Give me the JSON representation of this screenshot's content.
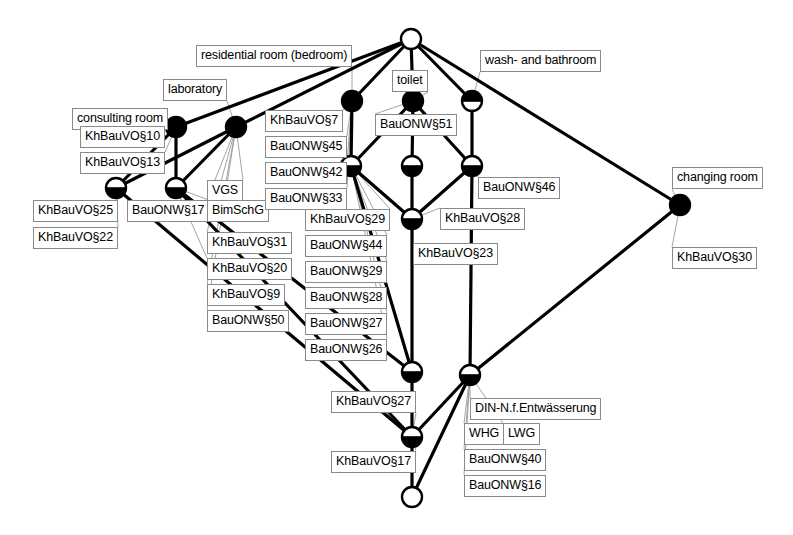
{
  "diagram": {
    "type": "concept-lattice",
    "title": "",
    "colors": {
      "line": "#000000",
      "node_fill": "#000000",
      "node_empty": "#ffffff",
      "label_border": "#8a8a8a",
      "label_background": "#ffffff",
      "leader_line": "#9a9a9a",
      "background": "#ffffff"
    },
    "object_labels": [
      {
        "id": "obj-residential-room",
        "text": "residential room (bedroom)",
        "x": 196,
        "y": 45,
        "node": "n-top-mid-left"
      },
      {
        "id": "obj-laboratory",
        "text": "laboratory",
        "x": 163,
        "y": 79,
        "node": "n-lab"
      },
      {
        "id": "obj-consulting-room",
        "text": "consulting room",
        "x": 72,
        "y": 108,
        "node": "n-consult"
      },
      {
        "id": "obj-toilet",
        "text": "toilet",
        "x": 392,
        "y": 70,
        "node": "n-toilet"
      },
      {
        "id": "obj-wash-bathroom",
        "text": "wash- and bathroom",
        "x": 480,
        "y": 50,
        "node": "n-wash"
      },
      {
        "id": "obj-changing-room",
        "text": "changing room",
        "x": 672,
        "y": 167,
        "node": "n-changing"
      }
    ],
    "attribute_labels": [
      {
        "id": "attr-khbauvo10",
        "text": "KhBauVO§10",
        "x": 80,
        "y": 126,
        "node": "n-consult"
      },
      {
        "id": "attr-khbauvo13",
        "text": "KhBauVO§13",
        "x": 80,
        "y": 152,
        "node": "n-consult"
      },
      {
        "id": "attr-khbauvo25",
        "text": "KhBauVO§25",
        "x": 33,
        "y": 200,
        "node": "n-l1"
      },
      {
        "id": "attr-khbauvo22",
        "text": "KhBauVO§22",
        "x": 33,
        "y": 227,
        "node": "n-l1"
      },
      {
        "id": "attr-bauonw17",
        "text": "BauONW§17",
        "x": 127,
        "y": 200,
        "node": "n-l2"
      },
      {
        "id": "attr-vgs",
        "text": "VGS",
        "x": 207,
        "y": 180,
        "node": "n-lab"
      },
      {
        "id": "attr-bimschg",
        "text": "BimSchG",
        "x": 207,
        "y": 200,
        "node": "n-lab"
      },
      {
        "id": "attr-khbauvo31",
        "text": "KhBauVO§31",
        "x": 207,
        "y": 232,
        "node": "n-lab"
      },
      {
        "id": "attr-khbauvo20",
        "text": "KhBauVO§20",
        "x": 207,
        "y": 258,
        "node": "n-l2"
      },
      {
        "id": "attr-khbauvo9",
        "text": "KhBauVO§9",
        "x": 207,
        "y": 284,
        "node": "n-lab"
      },
      {
        "id": "attr-bauonw50",
        "text": "BauONW§50",
        "x": 207,
        "y": 310,
        "node": "n-lab"
      },
      {
        "id": "attr-khbauvo7",
        "text": "KhBauVO§7",
        "x": 265,
        "y": 110,
        "node": "n-top-mid-left"
      },
      {
        "id": "attr-bauonw45",
        "text": "BauONW§45",
        "x": 265,
        "y": 136,
        "node": "n-top-mid-left"
      },
      {
        "id": "attr-bauonw42",
        "text": "BauONW§42",
        "x": 265,
        "y": 162,
        "node": "n-top-mid-left"
      },
      {
        "id": "attr-bauonw33",
        "text": "BauONW§33",
        "x": 265,
        "y": 188,
        "node": "n-top-mid-left"
      },
      {
        "id": "attr-khbauvo29",
        "text": "KhBauVO§29",
        "x": 305,
        "y": 209,
        "node": "n-m1"
      },
      {
        "id": "attr-bauonw44",
        "text": "BauONW§44",
        "x": 305,
        "y": 235,
        "node": "n-m1"
      },
      {
        "id": "attr-bauonw29",
        "text": "BauONW§29",
        "x": 305,
        "y": 261,
        "node": "n-m1"
      },
      {
        "id": "attr-bauonw28",
        "text": "BauONW§28",
        "x": 305,
        "y": 287,
        "node": "n-m1"
      },
      {
        "id": "attr-bauonw27",
        "text": "BauONW§27",
        "x": 305,
        "y": 313,
        "node": "n-m1"
      },
      {
        "id": "attr-bauonw26",
        "text": "BauONW§26",
        "x": 305,
        "y": 339,
        "node": "n-m1"
      },
      {
        "id": "attr-bauonw51",
        "text": "BauONW§51",
        "x": 375,
        "y": 114,
        "node": "n-toilet"
      },
      {
        "id": "attr-bauonw46",
        "text": "BauONW§46",
        "x": 478,
        "y": 177,
        "node": "n-wash2"
      },
      {
        "id": "attr-khbauvo28",
        "text": "KhBauVO§28",
        "x": 440,
        "y": 208,
        "node": "n-c2"
      },
      {
        "id": "attr-khbauvo23",
        "text": "KhBauVO§23",
        "x": 413,
        "y": 243,
        "node": "n-c2"
      },
      {
        "id": "attr-khbauvo27",
        "text": "KhBauVO§27",
        "x": 331,
        "y": 391,
        "node": "n-b2"
      },
      {
        "id": "attr-khbauvo17",
        "text": "KhBauVO§17",
        "x": 331,
        "y": 451,
        "node": "n-b2"
      },
      {
        "id": "attr-din-entwaesserung",
        "text": "DIN-N.f.Entwässerung",
        "x": 470,
        "y": 398,
        "node": "n-b3"
      },
      {
        "id": "attr-whg",
        "text": "WHG",
        "x": 464,
        "y": 423,
        "node": "n-b3"
      },
      {
        "id": "attr-lwg",
        "text": "LWG",
        "x": 503,
        "y": 423,
        "node": "n-b3"
      },
      {
        "id": "attr-bauonw40",
        "text": "BauONW§40",
        "x": 464,
        "y": 449,
        "node": "n-b3"
      },
      {
        "id": "attr-bauonw16",
        "text": "BauONW§16",
        "x": 464,
        "y": 475,
        "node": "n-b3"
      },
      {
        "id": "attr-khbauvo30",
        "text": "KhBauVO§30",
        "x": 672,
        "y": 247,
        "node": "n-changing"
      },
      {
        "id": "attr-khbauvo29b",
        "text": "",
        "x": 0,
        "y": 0,
        "node": ""
      }
    ],
    "nodes": [
      {
        "id": "n-top",
        "x": 411,
        "y": 39,
        "r": 10,
        "fill": "empty"
      },
      {
        "id": "n-consult",
        "x": 176,
        "y": 127,
        "r": 10,
        "fill": "full"
      },
      {
        "id": "n-lab",
        "x": 236,
        "y": 127,
        "r": 10,
        "fill": "full"
      },
      {
        "id": "n-top-mid-left",
        "x": 352,
        "y": 101,
        "r": 10,
        "fill": "full"
      },
      {
        "id": "n-toilet",
        "x": 413,
        "y": 101,
        "r": 10,
        "fill": "full"
      },
      {
        "id": "n-wash",
        "x": 472,
        "y": 101,
        "r": 10,
        "fill": "top"
      },
      {
        "id": "n-changing",
        "x": 680,
        "y": 205,
        "r": 10,
        "fill": "full"
      },
      {
        "id": "n-l1",
        "x": 116,
        "y": 188,
        "r": 10,
        "fill": "bottom"
      },
      {
        "id": "n-l2",
        "x": 176,
        "y": 188,
        "r": 10,
        "fill": "bottom"
      },
      {
        "id": "n-m1",
        "x": 351,
        "y": 166,
        "r": 10,
        "fill": "bottom"
      },
      {
        "id": "n-m2",
        "x": 412,
        "y": 166,
        "r": 10,
        "fill": "bottom"
      },
      {
        "id": "n-wash2",
        "x": 472,
        "y": 166,
        "r": 10,
        "fill": "bottom"
      },
      {
        "id": "n-c2",
        "x": 412,
        "y": 219,
        "r": 10,
        "fill": "bottom"
      },
      {
        "id": "n-b1",
        "x": 412,
        "y": 372,
        "r": 10,
        "fill": "bottom"
      },
      {
        "id": "n-b3",
        "x": 470,
        "y": 375,
        "r": 10,
        "fill": "bottom"
      },
      {
        "id": "n-b2",
        "x": 412,
        "y": 437,
        "r": 10,
        "fill": "bottom"
      },
      {
        "id": "n-bottom",
        "x": 412,
        "y": 497,
        "r": 10,
        "fill": "empty"
      }
    ],
    "edges": [
      {
        "from": "n-top",
        "to": "n-consult"
      },
      {
        "from": "n-top",
        "to": "n-lab"
      },
      {
        "from": "n-top",
        "to": "n-top-mid-left"
      },
      {
        "from": "n-top",
        "to": "n-toilet"
      },
      {
        "from": "n-top",
        "to": "n-wash"
      },
      {
        "from": "n-top",
        "to": "n-changing"
      },
      {
        "from": "n-consult",
        "to": "n-l1"
      },
      {
        "from": "n-consult",
        "to": "n-l2"
      },
      {
        "from": "n-lab",
        "to": "n-l1"
      },
      {
        "from": "n-lab",
        "to": "n-l2"
      },
      {
        "from": "n-top-mid-left",
        "to": "n-m1"
      },
      {
        "from": "n-toilet",
        "to": "n-m1"
      },
      {
        "from": "n-toilet",
        "to": "n-m2"
      },
      {
        "from": "n-wash",
        "to": "n-wash2"
      },
      {
        "from": "n-toilet",
        "to": "n-wash2"
      },
      {
        "from": "n-m1",
        "to": "n-c2"
      },
      {
        "from": "n-m2",
        "to": "n-c2"
      },
      {
        "from": "n-wash2",
        "to": "n-c2"
      },
      {
        "from": "n-wash2",
        "to": "n-b3"
      },
      {
        "from": "n-c2",
        "to": "n-b1"
      },
      {
        "from": "n-l1",
        "to": "n-b2"
      },
      {
        "from": "n-l2",
        "to": "n-b1"
      },
      {
        "from": "n-l2",
        "to": "n-b2"
      },
      {
        "from": "n-m1",
        "to": "n-b1"
      },
      {
        "from": "n-b1",
        "to": "n-b2"
      },
      {
        "from": "n-b3",
        "to": "n-b2"
      },
      {
        "from": "n-b2",
        "to": "n-bottom"
      },
      {
        "from": "n-b3",
        "to": "n-bottom"
      },
      {
        "from": "n-changing",
        "to": "n-b3"
      }
    ]
  }
}
